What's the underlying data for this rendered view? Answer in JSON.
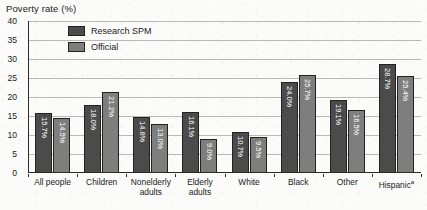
{
  "chart_data": {
    "type": "bar",
    "title": "Poverty rate (%)",
    "xlabel": "",
    "ylabel": "Poverty rate (%)",
    "ylim": [
      0,
      40
    ],
    "ytick_step": 5,
    "yticks": [
      "0",
      "5",
      "10",
      "15",
      "20",
      "25",
      "30",
      "35",
      "40"
    ],
    "grid": "horizontal",
    "legend_position": "inside-top-left",
    "categories": [
      "All people",
      "Children",
      "Nonelderly adults",
      "Elderly adults",
      "White",
      "Black",
      "Other",
      "Hispanic"
    ],
    "category_labels": [
      "All people",
      "Children",
      "Nonelderly\nadults",
      "Elderly\nadults",
      "White",
      "Black",
      "Other",
      "Hispanic"
    ],
    "category_footnotes": [
      "",
      "",
      "",
      "",
      "",
      "",
      "",
      "a"
    ],
    "series": [
      {
        "name": "Research SPM",
        "color": "#4b4b4b",
        "values": [
          15.7,
          18.0,
          14.8,
          16.1,
          10.7,
          24.0,
          19.1,
          28.7
        ],
        "value_labels": [
          "15.7%",
          "18.0%",
          "14.8%",
          "16.1%",
          "10.7%",
          "24.0%",
          "19.1%",
          "28.7%"
        ]
      },
      {
        "name": "Official",
        "color": "#7e7e7e",
        "values": [
          14.5,
          21.2,
          13.0,
          9.0,
          9.5,
          25.7,
          16.5,
          25.4
        ],
        "value_labels": [
          "14.5%",
          "21.2%",
          "13.0%",
          "9.0%",
          "9.5%",
          "25.7%",
          "16.5%",
          "25.4%"
        ]
      }
    ]
  },
  "colors": {
    "background": "#fbfbf9",
    "axis": "#2b2b2b",
    "gridline": "#b9b9b5",
    "text": "#1a1a1a",
    "value_label": "#ffffff"
  }
}
